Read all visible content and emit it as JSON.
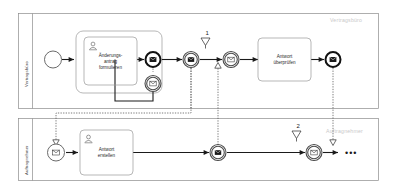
{
  "diagram": {
    "type": "bpmn-collaboration",
    "pools": [
      {
        "id": "pool-vertragsbuero",
        "lane_label": "Vertragsbüro",
        "watermark_label": "Vertragsbüro"
      },
      {
        "id": "pool-auftragnehmer",
        "lane_label": "Auftragnehmer",
        "watermark_label": "Auftragnehmer"
      }
    ],
    "tasks": [
      {
        "id": "task-aenderungsantrag",
        "label_lines": [
          "Änderungs-",
          "antrag",
          "formulieren"
        ],
        "icon": "user-task-icon",
        "pool": "pool-vertragsbuero"
      },
      {
        "id": "task-antwort-ueberpruefen",
        "label_lines": [
          "Antwort",
          "überprüfen"
        ],
        "icon": "none",
        "pool": "pool-vertragsbuero"
      },
      {
        "id": "task-antwort-erstellen",
        "label_lines": [
          "Antwort",
          "erstellen"
        ],
        "icon": "user-task-icon",
        "pool": "pool-auftragnehmer"
      }
    ],
    "events": [
      {
        "id": "start-event-blank",
        "kind": "start-event",
        "icon": "none",
        "pool": "pool-vertragsbuero"
      },
      {
        "id": "end-event-message-1",
        "kind": "message-end-event",
        "icon": "envelope-filled-icon",
        "pool": "pool-vertragsbuero"
      },
      {
        "id": "boundary-event-message",
        "kind": "boundary-message-catch-event",
        "icon": "envelope-outline-icon",
        "pool": "pool-vertragsbuero"
      },
      {
        "id": "intermediate-throw-message-1",
        "kind": "message-throw-event",
        "icon": "envelope-filled-icon",
        "pool": "pool-vertragsbuero"
      },
      {
        "id": "intermediate-catch-message-1",
        "kind": "message-catch-event",
        "icon": "envelope-outline-icon",
        "pool": "pool-vertragsbuero"
      },
      {
        "id": "end-event-message-2",
        "kind": "message-end-event",
        "icon": "envelope-filled-icon",
        "pool": "pool-vertragsbuero"
      },
      {
        "id": "start-event-message",
        "kind": "message-start-event",
        "icon": "envelope-outline-icon",
        "pool": "pool-auftragnehmer"
      },
      {
        "id": "intermediate-throw-message-2",
        "kind": "message-throw-event",
        "icon": "envelope-filled-icon",
        "pool": "pool-auftragnehmer"
      },
      {
        "id": "intermediate-catch-message-2",
        "kind": "message-catch-event",
        "icon": "envelope-outline-icon",
        "pool": "pool-auftragnehmer"
      }
    ],
    "annotations": [
      {
        "id": "marker-1",
        "number": "1",
        "icon": "funnel-triangle-icon",
        "pool": "pool-vertragsbuero"
      },
      {
        "id": "marker-2",
        "number": "2",
        "icon": "funnel-triangle-icon",
        "pool": "pool-auftragnehmer"
      }
    ],
    "continuation": {
      "id": "flow-continuation",
      "symbol": "•••"
    },
    "colors": {
      "lane_border": "#8c8c8c",
      "group_border": "#9a9a9a",
      "sequence_flow": "#1a1a1a",
      "message_flow": "#5a5a5a",
      "watermark_text": "#c9c9c9",
      "task_text": "#2b2b2b",
      "lane_text": "#3c3c3c",
      "background": "#ffffff"
    }
  }
}
